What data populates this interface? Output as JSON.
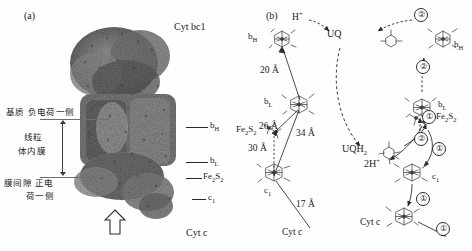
{
  "figure": {
    "panels": [
      {
        "key": "a",
        "letter": "(a)"
      },
      {
        "key": "b",
        "letter": "(b)"
      }
    ]
  },
  "panel_a": {
    "letter": "(a)",
    "title_label": "Cyt bc1",
    "bottom_label": "Cyt c",
    "membrane_labels": {
      "matrix_side": "基质 负电荷一侧",
      "inner_membrane_line1": "线粒",
      "inner_membrane_line2": "体内膜",
      "intermembrane_line1": "膜间隙 正电",
      "intermembrane_line2": "荷一侧"
    },
    "cofactors": [
      {
        "name": "bH",
        "base": "b",
        "sub": "H"
      },
      {
        "name": "bL",
        "base": "b",
        "sub": "L"
      },
      {
        "name": "Fe2S2",
        "base": "Fe",
        "sub": "2",
        "base2": "S",
        "sub2": "2"
      },
      {
        "name": "c1",
        "base": "c",
        "sub": "1"
      }
    ],
    "proton_arrow": "open-up-arrow"
  },
  "panel_b": {
    "letter": "(b)",
    "left_scheme": {
      "cofactor_labels": [
        {
          "id": "bH",
          "base": "b",
          "sub": "H"
        },
        {
          "id": "bL",
          "base": "b",
          "sub": "L"
        },
        {
          "id": "Fe2S2",
          "base": "Fe",
          "sub": "2",
          "base2": "S",
          "sub2": "2"
        },
        {
          "id": "c1",
          "base": "c",
          "sub": "1"
        }
      ],
      "distances": [
        "20 Å",
        "26 Å",
        "34 Å",
        "30 Å",
        "17 Å"
      ],
      "cyt_c_label": "Cyt c"
    },
    "right_scheme": {
      "species": [
        {
          "id": "proton-in",
          "text": "H",
          "sup": "+"
        },
        {
          "id": "uq",
          "text": "UQ"
        },
        {
          "id": "uqh2",
          "text": "UQH",
          "sub": "2"
        },
        {
          "id": "protons-out",
          "text": "2H",
          "sup": "+"
        }
      ],
      "cofactor_labels": [
        {
          "id": "bH-right",
          "base": "b",
          "sub": "H"
        },
        {
          "id": "bL-right",
          "base": "b",
          "sub": "L"
        },
        {
          "id": "Fe2S2-right",
          "base": "Fe",
          "sub": "2",
          "base2": "S",
          "sub2": "2"
        },
        {
          "id": "c1-right",
          "base": "c",
          "sub": "1"
        }
      ],
      "cyt_c_label": "Cyt c",
      "step_markers": [
        "②",
        "②",
        "②",
        "①",
        "①",
        "①",
        "①"
      ],
      "step_one": "①",
      "step_two": "②"
    }
  },
  "colors": {
    "ink": "#1a1a1a",
    "line": "#2b2b2b",
    "membrane": "#6f6f6f",
    "protein_dark": "#4a4a4a",
    "protein_mid": "#8d8d8d",
    "protein_light": "#c9c9c9",
    "background": "#ffffff"
  }
}
